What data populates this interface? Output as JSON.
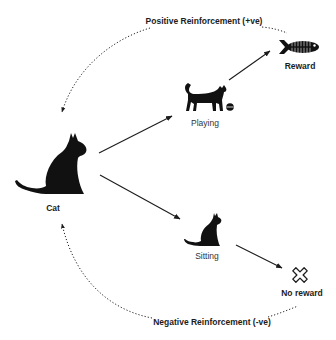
{
  "diagram": {
    "nodes": {
      "cat": {
        "label": "Cat",
        "icon": "sitting-cat-large-icon"
      },
      "playing": {
        "label": "Playing",
        "icon": "walking-cat-icon",
        "extra_icon": "ball-icon"
      },
      "sitting": {
        "label": "Sitting",
        "icon": "sitting-cat-small-icon"
      },
      "reward": {
        "label": "Reward",
        "icon": "fish-icon"
      },
      "no_reward": {
        "label": "No reward",
        "icon": "x-icon"
      }
    },
    "loops": {
      "positive": {
        "label": "Positive Reinforcement (+ve)",
        "from": "reward",
        "to": "cat",
        "style": "dotted"
      },
      "negative": {
        "label": "Negative Reinforcement (-ve)",
        "from": "no_reward",
        "to": "cat",
        "style": "dotted"
      }
    },
    "edges": [
      {
        "from": "cat",
        "to": "playing",
        "style": "solid"
      },
      {
        "from": "cat",
        "to": "sitting",
        "style": "solid"
      },
      {
        "from": "playing",
        "to": "reward",
        "style": "solid"
      },
      {
        "from": "sitting",
        "to": "no_reward",
        "style": "solid"
      }
    ],
    "colors": {
      "ink": "#1c1c1c",
      "background": "#ffffff"
    }
  }
}
